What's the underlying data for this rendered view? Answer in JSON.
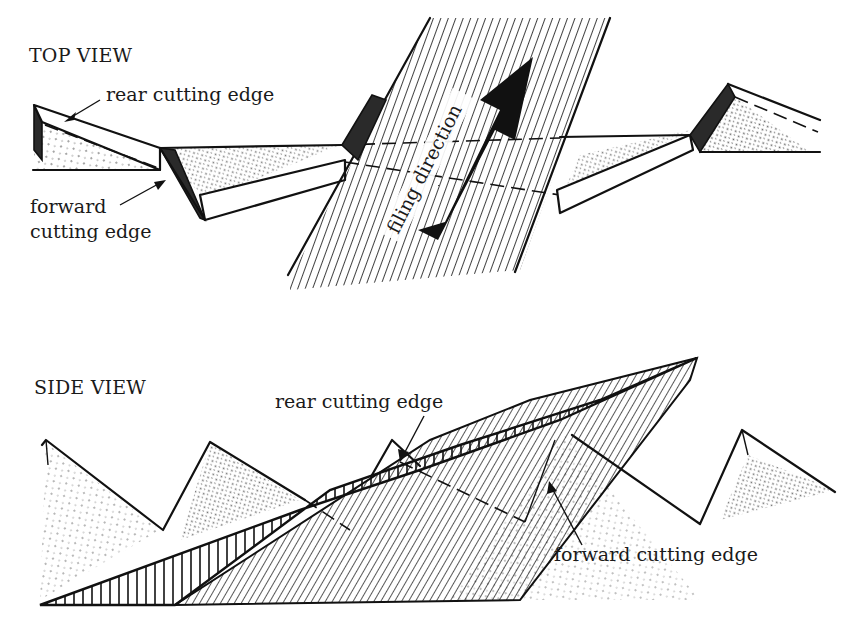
{
  "figure": {
    "top_view": {
      "heading": "TOP VIEW",
      "labels": {
        "rear": "rear cutting edge",
        "forward_line1": "forward",
        "forward_line2": "cutting edge",
        "arrow_text": "filing direction"
      }
    },
    "side_view": {
      "heading": "SIDE VIEW",
      "labels": {
        "rear": "rear cutting edge",
        "forward": "forward cutting edge"
      }
    },
    "colors": {
      "ink": "#111111",
      "paper": "#ffffff",
      "arrow": "#111111"
    }
  }
}
